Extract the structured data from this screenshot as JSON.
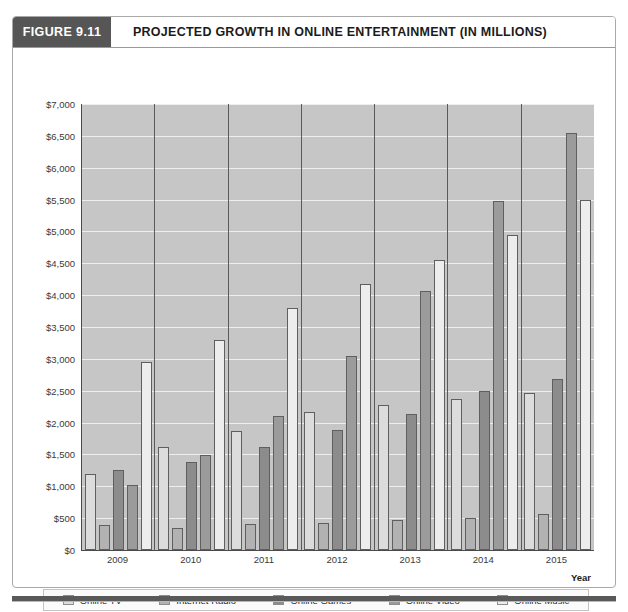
{
  "figure": {
    "number_label": "FIGURE 9.11",
    "title": "PROJECTED GROWTH IN ONLINE ENTERTAINMENT (IN MILLIONS)"
  },
  "chart_data": {
    "type": "bar",
    "title": "PROJECTED GROWTH IN ONLINE ENTERTAINMENT (IN MILLIONS)",
    "xlabel": "Year",
    "ylabel": "",
    "categories": [
      "2009",
      "2010",
      "2011",
      "2012",
      "2013",
      "2014",
      "2015"
    ],
    "series": [
      {
        "name": "Online TV",
        "color": "#dcdcdc",
        "values": [
          1200,
          1620,
          1870,
          2160,
          2270,
          2370,
          2460
        ]
      },
      {
        "name": "Internet Radio",
        "color": "#b2b2b2",
        "values": [
          400,
          350,
          410,
          430,
          470,
          510,
          560
        ]
      },
      {
        "name": "Online Games",
        "color": "#8c8c8c",
        "values": [
          1250,
          1380,
          1610,
          1880,
          2140,
          2500,
          2690
        ]
      },
      {
        "name": "Online Video",
        "color": "#9b9b9b",
        "values": [
          1020,
          1490,
          2100,
          3040,
          4070,
          5480,
          6550
        ]
      },
      {
        "name": "Online Music",
        "color": "#ededed",
        "values": [
          2950,
          3300,
          3800,
          4170,
          4550,
          4950,
          5500
        ]
      }
    ],
    "ylim": [
      0,
      7000
    ],
    "ytick_step": 500,
    "ytick_labels": [
      "$7,000",
      "$6,500",
      "$6,000",
      "$5,500",
      "$5,000",
      "$4,500",
      "$4,000",
      "$3,500",
      "$3,000",
      "$2,500",
      "$2,000",
      "$1,500",
      "$1,000",
      "$500",
      "$0"
    ],
    "ytick_values": [
      7000,
      6500,
      6000,
      5500,
      5000,
      4500,
      4000,
      3500,
      3000,
      2500,
      2000,
      1500,
      1000,
      500,
      0
    ],
    "grid": true,
    "legend_position": "bottom",
    "plot_background": "#c6c6c6"
  },
  "legend": {
    "items": [
      {
        "label": "Online TV"
      },
      {
        "label": "Internet Radio"
      },
      {
        "label": "Online Games"
      },
      {
        "label": "Online Video"
      },
      {
        "label": "Online Music"
      }
    ]
  },
  "axis": {
    "x_title": "Year"
  }
}
